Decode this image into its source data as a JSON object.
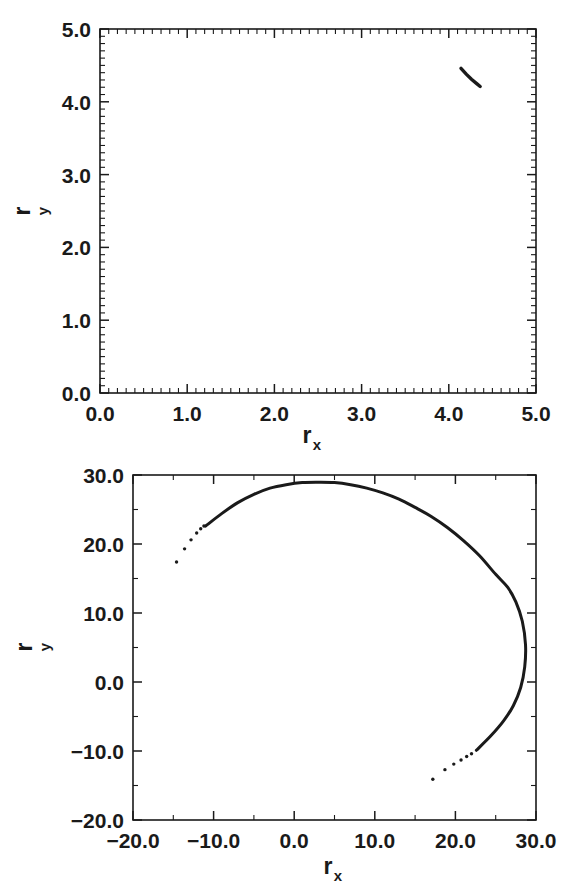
{
  "figure": {
    "title": "",
    "background": "#ffffff",
    "ink_color": "#1a1a1a"
  },
  "chart_data": [
    {
      "id": "panel-top",
      "type": "line",
      "title": "",
      "xlabel": "r_x",
      "ylabel": "r_y",
      "xlabel_base": "r",
      "xlabel_sub": "x",
      "ylabel_base": "r",
      "ylabel_sub": "y",
      "xlim": [
        0.0,
        5.0
      ],
      "ylim": [
        0.0,
        5.0
      ],
      "xticks": [
        0.0,
        1.0,
        2.0,
        3.0,
        4.0,
        5.0
      ],
      "yticks": [
        0.0,
        1.0,
        2.0,
        3.0,
        4.0,
        5.0
      ],
      "xticklabels": [
        "0.0",
        "1.0",
        "2.0",
        "3.0",
        "4.0",
        "5.0"
      ],
      "yticklabels": [
        "0.0",
        "1.0",
        "2.0",
        "3.0",
        "4.0",
        "5.0"
      ],
      "minor_tick_step": 0.1,
      "grid": false,
      "legend": null,
      "series": [
        {
          "name": "trajectory-segment",
          "style": "solid-line",
          "x": [
            4.14,
            4.2,
            4.26,
            4.32,
            4.36
          ],
          "y": [
            4.46,
            4.38,
            4.31,
            4.25,
            4.21
          ]
        }
      ]
    },
    {
      "id": "panel-bottom",
      "type": "line",
      "title": "",
      "xlabel": "r_x",
      "ylabel": "r_y",
      "xlabel_base": "r",
      "xlabel_sub": "x",
      "ylabel_base": "r",
      "ylabel_sub": "y",
      "xlim": [
        -20.0,
        30.0
      ],
      "ylim": [
        -20.0,
        30.0
      ],
      "xticks": [
        -20.0,
        -10.0,
        0.0,
        10.0,
        20.0,
        30.0
      ],
      "yticks": [
        -20.0,
        -10.0,
        0.0,
        10.0,
        20.0,
        30.0
      ],
      "xticklabels": [
        "-20.0",
        "-10.0",
        "0.0",
        "10.0",
        "20.0",
        "30.0"
      ],
      "yticklabels": [
        "-20.0",
        "-10.0",
        "0.0",
        "10.0",
        "20.0",
        "30.0"
      ],
      "minor_tick_step": 5.0,
      "grid": false,
      "legend": null,
      "series": [
        {
          "name": "trajectory-arc",
          "style": "solid-line-with-sparse-dots",
          "x": [
            -11.0,
            -9.0,
            -7.0,
            -5.0,
            -3.0,
            -1.0,
            1.0,
            3.0,
            5.0,
            7.0,
            9.0,
            11.0,
            13.0,
            15.0,
            17.0,
            19.0,
            21.0,
            23.0,
            25.0,
            26.5,
            27.5,
            28.3,
            28.7,
            28.6,
            28.1,
            27.2,
            26.0,
            24.4,
            22.6
          ],
          "y": [
            22.6,
            24.4,
            26.0,
            27.2,
            28.1,
            28.6,
            28.9,
            28.95,
            28.9,
            28.6,
            28.1,
            27.4,
            26.5,
            25.3,
            24.0,
            22.4,
            20.5,
            18.3,
            15.6,
            13.7,
            11.6,
            8.8,
            5.4,
            2.2,
            -0.8,
            -3.4,
            -5.6,
            -7.8,
            -9.9
          ]
        },
        {
          "name": "trajectory-dots-upper-left",
          "style": "scatter-dots",
          "x": [
            -14.6,
            -13.6,
            -12.8,
            -12.1,
            -11.6,
            -11.2
          ],
          "y": [
            17.4,
            19.3,
            20.6,
            21.6,
            22.2,
            22.6
          ]
        },
        {
          "name": "trajectory-dots-lower-right",
          "style": "scatter-dots",
          "x": [
            17.2,
            18.7,
            19.8,
            20.7,
            21.4,
            22.0
          ],
          "y": [
            -14.1,
            -12.7,
            -11.9,
            -11.3,
            -10.8,
            -10.4
          ]
        }
      ]
    }
  ],
  "panels": {
    "top": {
      "name": "upper-plot-panel",
      "xaxis_label_text": "r",
      "xaxis_label_sub": "x",
      "yaxis_label_text": "r",
      "yaxis_label_sub": "y"
    },
    "bottom": {
      "name": "lower-plot-panel",
      "xaxis_label_text": "r",
      "xaxis_label_sub": "x",
      "yaxis_label_text": "r",
      "yaxis_label_sub": "y"
    }
  }
}
